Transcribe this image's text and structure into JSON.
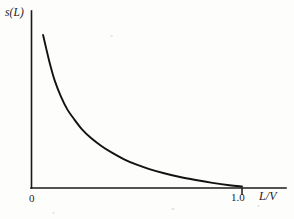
{
  "figure": {
    "background_color": "#fdfdfb",
    "ink_color": "#121212",
    "y_axis_label": "s(L)",
    "x_axis_label": "L/V",
    "tick_label_origin": "0",
    "tick_label_one": "1.0"
  },
  "chart_data": {
    "type": "line",
    "title": "",
    "subtitle": "",
    "xlabel": "L/V",
    "ylabel": "s(L)",
    "xlim": [
      0,
      1.2
    ],
    "ylim": [
      0,
      1.0
    ],
    "grid": false,
    "legend": null,
    "x_ticks": [
      0,
      1.0
    ],
    "x_tick_labels": [
      "0",
      "1.0"
    ],
    "y_ticks": [],
    "y_tick_labels": [],
    "annotations": [],
    "series": [
      {
        "name": "s(L)",
        "color": "#121212",
        "x": [
          0.055,
          0.07,
          0.09,
          0.11,
          0.14,
          0.17,
          0.2,
          0.24,
          0.28,
          0.33,
          0.38,
          0.44,
          0.5,
          0.56,
          0.63,
          0.7,
          0.78,
          0.86,
          0.94,
          1.0
        ],
        "y": [
          0.875,
          0.8,
          0.705,
          0.625,
          0.535,
          0.465,
          0.415,
          0.355,
          0.31,
          0.265,
          0.228,
          0.19,
          0.16,
          0.136,
          0.113,
          0.094,
          0.076,
          0.06,
          0.047,
          0.04
        ]
      }
    ]
  }
}
